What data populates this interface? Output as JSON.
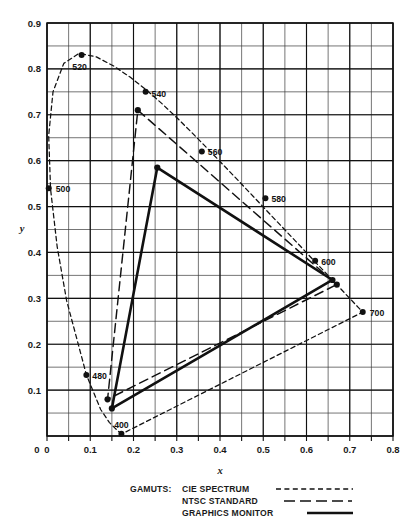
{
  "figure": {
    "axis_x_title": "x",
    "axis_y_title": "y"
  },
  "legend": {
    "header": "GAMUTS:",
    "items": [
      {
        "label": "CIE SPECTRUM",
        "style": "short-dash"
      },
      {
        "label": "NTSC STANDARD",
        "style": "long-dash"
      },
      {
        "label": "GRAPHICS MONITOR",
        "style": "solid"
      }
    ]
  },
  "chart_data": {
    "type": "line",
    "title": "",
    "xlabel": "x",
    "ylabel": "y",
    "xlim": [
      0,
      0.8
    ],
    "ylim": [
      0,
      0.9
    ],
    "xticks": [
      "0",
      "0.1",
      "0.2",
      "0.3",
      "0.4",
      "0.5",
      "0.6",
      "0.7",
      "0.8"
    ],
    "xtick_values": [
      0,
      0.1,
      0.2,
      0.3,
      0.4,
      0.5,
      0.6,
      0.7,
      0.8
    ],
    "yticks": [
      "0",
      "0.1",
      "0.2",
      "0.3",
      "0.4",
      "0.5",
      "0.6",
      "0.7",
      "0.8",
      "0.9"
    ],
    "ytick_values": [
      0,
      0.1,
      0.2,
      0.3,
      0.4,
      0.5,
      0.6,
      0.7,
      0.8,
      0.9
    ],
    "grid": true,
    "grid_minor_step": 0.05,
    "legend_position": "below-plot",
    "series": [
      {
        "name": "CIE SPECTRUM",
        "style": "short-dash",
        "closed": true,
        "points": [
          [
            0.1738,
            0.0049
          ],
          [
            0.1733,
            0.0048
          ],
          [
            0.1726,
            0.0048
          ],
          [
            0.1714,
            0.0051
          ],
          [
            0.1689,
            0.0069
          ],
          [
            0.1644,
            0.0109
          ],
          [
            0.1566,
            0.0177
          ],
          [
            0.144,
            0.0297
          ],
          [
            0.1241,
            0.0578
          ],
          [
            0.0913,
            0.1327
          ],
          [
            0.0454,
            0.295
          ],
          [
            0.0235,
            0.4127
          ],
          [
            0.0082,
            0.5384
          ],
          [
            0.0039,
            0.6548
          ],
          [
            0.0139,
            0.7502
          ],
          [
            0.0389,
            0.812
          ],
          [
            0.0743,
            0.8338
          ],
          [
            0.1142,
            0.8262
          ],
          [
            0.1547,
            0.8059
          ],
          [
            0.1929,
            0.7816
          ],
          [
            0.2296,
            0.7543
          ],
          [
            0.2658,
            0.7243
          ],
          [
            0.3016,
            0.6923
          ],
          [
            0.3373,
            0.6589
          ],
          [
            0.3731,
            0.6245
          ],
          [
            0.4087,
            0.5896
          ],
          [
            0.4441,
            0.5547
          ],
          [
            0.4788,
            0.5202
          ],
          [
            0.5125,
            0.4866
          ],
          [
            0.5448,
            0.4544
          ],
          [
            0.5752,
            0.4242
          ],
          [
            0.6029,
            0.3965
          ],
          [
            0.627,
            0.3725
          ],
          [
            0.6482,
            0.3514
          ],
          [
            0.6658,
            0.334
          ],
          [
            0.6801,
            0.3197
          ],
          [
            0.6915,
            0.3083
          ],
          [
            0.7006,
            0.2993
          ],
          [
            0.7079,
            0.292
          ],
          [
            0.714,
            0.2859
          ],
          [
            0.719,
            0.2809
          ],
          [
            0.723,
            0.277
          ],
          [
            0.726,
            0.274
          ],
          [
            0.7283,
            0.2717
          ],
          [
            0.73,
            0.27
          ]
        ]
      },
      {
        "name": "NTSC STANDARD",
        "style": "long-dash",
        "closed": true,
        "points": [
          [
            0.21,
            0.71
          ],
          [
            0.67,
            0.33
          ],
          [
            0.14,
            0.08
          ]
        ]
      },
      {
        "name": "GRAPHICS MONITOR",
        "style": "solid",
        "closed": true,
        "points": [
          [
            0.255,
            0.585
          ],
          [
            0.66,
            0.34
          ],
          [
            0.15,
            0.06
          ]
        ]
      }
    ],
    "annotations": [
      {
        "label": "520",
        "x": 0.08,
        "y": 0.83,
        "dx": -2,
        "dy": 15,
        "anchor": "middle"
      },
      {
        "label": "540",
        "x": 0.228,
        "y": 0.75,
        "dx": 6,
        "dy": 5,
        "anchor": "start"
      },
      {
        "label": "560",
        "x": 0.358,
        "y": 0.62,
        "dx": 6,
        "dy": 4,
        "anchor": "start"
      },
      {
        "label": "580",
        "x": 0.505,
        "y": 0.518,
        "dx": 6,
        "dy": 4,
        "anchor": "start"
      },
      {
        "label": "600",
        "x": 0.62,
        "y": 0.382,
        "dx": 6,
        "dy": 4,
        "anchor": "start"
      },
      {
        "label": "700",
        "x": 0.73,
        "y": 0.27,
        "dx": 7,
        "dy": 4,
        "anchor": "start"
      },
      {
        "label": "500",
        "x": 0.004,
        "y": 0.54,
        "dx": 7,
        "dy": 4,
        "anchor": "start"
      },
      {
        "label": "480",
        "x": 0.091,
        "y": 0.133,
        "dx": 6,
        "dy": 4,
        "anchor": "start"
      },
      {
        "label": "400",
        "x": 0.172,
        "y": 0.005,
        "dx": 0,
        "dy": -6,
        "anchor": "middle"
      }
    ]
  }
}
